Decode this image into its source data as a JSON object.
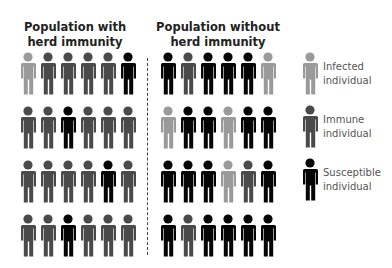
{
  "colors": {
    "infected": "#9a9a9a",
    "immune": "#4a4a4a",
    "susceptible": "#050505"
  },
  "panels": {
    "left": {
      "title": "Population with herd immunity",
      "rows": [
        [
          "infected",
          "immune",
          "immune",
          "immune",
          "immune",
          "susceptible"
        ],
        [
          "immune",
          "immune",
          "susceptible",
          "immune",
          "immune",
          "immune"
        ],
        [
          "immune",
          "immune",
          "immune",
          "immune",
          "susceptible",
          "immune"
        ],
        [
          "immune",
          "immune",
          "susceptible",
          "immune",
          "immune",
          "immune"
        ]
      ]
    },
    "right": {
      "title": "Population without herd immunity",
      "rows": [
        [
          "susceptible",
          "immune",
          "susceptible",
          "susceptible",
          "susceptible",
          "infected"
        ],
        [
          "infected",
          "susceptible",
          "susceptible",
          "infected",
          "susceptible",
          "susceptible"
        ],
        [
          "susceptible",
          "susceptible",
          "susceptible",
          "infected",
          "immune",
          "susceptible"
        ],
        [
          "susceptible",
          "immune",
          "susceptible",
          "susceptible",
          "susceptible",
          "susceptible"
        ]
      ]
    }
  },
  "legend": [
    {
      "key": "infected",
      "label": "Infected individual",
      "icon": "person-icon"
    },
    {
      "key": "immune",
      "label": "Immune individual",
      "icon": "person-icon"
    },
    {
      "key": "susceptible",
      "label": "Susceptible individual",
      "icon": "person-icon"
    }
  ]
}
